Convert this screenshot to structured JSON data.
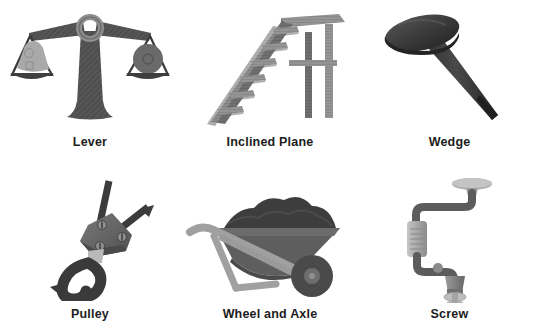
{
  "page": {
    "background_color": "#ffffff",
    "layout": "3-column x 2-row grid of labeled illustrations",
    "label_color": "#1c1c1c"
  },
  "palette": {
    "dark": "#4a4a4a",
    "darker": "#3a3a3a",
    "darkest": "#2e2e2e",
    "mid": "#6e6e6e",
    "light": "#9a9a9a",
    "lighter": "#b4b4b4",
    "lightest": "#c9c9c9",
    "soil": "#3d3d3d",
    "wood": "#8c8c8c",
    "wood_dark": "#6a6a6a"
  },
  "items": [
    {
      "id": "lever",
      "label": "Lever",
      "icon": "balance-scale-icon",
      "row": 1,
      "column": 1,
      "description": "Balance scale with central post, crossbeam, ring pivot and two hanging pans holding weights"
    },
    {
      "id": "inclined-plane",
      "label": "Inclined Plane",
      "icon": "staircase-ramp-icon",
      "row": 1,
      "column": 2,
      "description": "Wooden stepped ramp rising to a raised platform supported by posts"
    },
    {
      "id": "wedge",
      "label": "Wedge",
      "icon": "nail-icon",
      "row": 1,
      "column": 3,
      "description": "Nail with a flat round head and a tapered shaft ending in a sharp point"
    },
    {
      "id": "pulley",
      "label": "Pulley",
      "icon": "pulley-block-hook-icon",
      "row": 2,
      "column": 1,
      "description": "Pulley block with bolts, two ropes leading up and a large hook hanging below"
    },
    {
      "id": "wheel-and-axle",
      "label": "Wheel and Axle",
      "icon": "wheelbarrow-icon",
      "row": 2,
      "column": 2,
      "description": "Wheelbarrow loaded with dark soil, with handle, legs and a single wheel"
    },
    {
      "id": "screw",
      "label": "Screw",
      "icon": "hand-drill-auger-icon",
      "row": 2,
      "column": 3,
      "description": "Hand crank drill with knob handle, grip body and a spiral auger screw bit"
    }
  ]
}
